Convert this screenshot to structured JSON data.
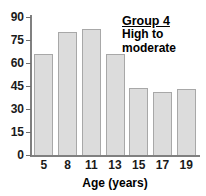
{
  "chart_data": {
    "type": "bar",
    "title": "Group 4",
    "subtitle_lines": [
      "High to",
      "moderate"
    ],
    "categories": [
      "5",
      "8",
      "11",
      "13",
      "15",
      "17",
      "19"
    ],
    "values": [
      66,
      80,
      82,
      66,
      44,
      41,
      43
    ],
    "xlabel": "Age (years)",
    "ylabel": "",
    "ylim": [
      0,
      90
    ],
    "yticks": [
      0,
      15,
      30,
      45,
      60,
      75,
      90
    ],
    "ytick_labels": [
      "0",
      "15",
      "30",
      "45",
      "60",
      "75",
      "90"
    ],
    "grid": false,
    "legend_position": "top-right",
    "bar_fill": "#dcdcdc",
    "bar_stroke": "#a8a8a8",
    "axis_color": "#808080",
    "text_color": "#000000"
  }
}
